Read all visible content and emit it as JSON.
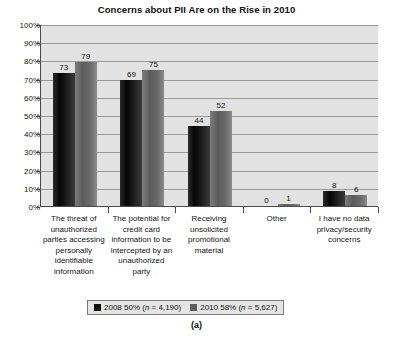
{
  "chart_data": {
    "type": "bar",
    "title": "Concerns about PII Are on the Rise in 2010",
    "xlabel": "",
    "ylabel": "",
    "ylim": [
      0,
      100
    ],
    "ytick_labels": [
      "100%",
      "90%",
      "80%",
      "70%",
      "60%",
      "50%",
      "40%",
      "30%",
      "20%",
      "10%",
      "0%"
    ],
    "ytick_values": [
      100,
      90,
      80,
      70,
      60,
      50,
      40,
      30,
      20,
      10,
      0
    ],
    "grid": "horizontal",
    "legend_position": "bottom",
    "categories": [
      "The threat of unauthorized parties accessing personally identifiable information",
      "The potential for credit card information to be intercepted by an unauthorized party",
      "Receiving unsolicited promotional material",
      "Other",
      "I have no data privacy/security concerns"
    ],
    "series": [
      {
        "name": "2008 50% (n = 4,190)",
        "color": "#101010",
        "values": [
          73,
          69,
          44,
          0,
          8
        ]
      },
      {
        "name": "2010 58% (n = 5,627)",
        "color": "#5e5e5e",
        "values": [
          79,
          75,
          52,
          1,
          6
        ]
      }
    ]
  },
  "legend": {
    "entries": [
      {
        "label_prefix": "2008 50% (",
        "label_italic": "n",
        "label_suffix": " = 4,190)"
      },
      {
        "label_prefix": "2010 58% (",
        "label_italic": "n",
        "label_suffix": " = 5,627)"
      }
    ]
  },
  "caption": "(a)"
}
